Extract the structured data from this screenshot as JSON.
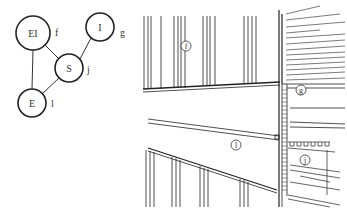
{
  "graph": {
    "nodes": [
      {
        "id": "EI",
        "label": "EI",
        "annotation": "f",
        "cx": 33,
        "cy": 33,
        "r": 17
      },
      {
        "id": "I",
        "label": "I",
        "annotation": "g",
        "cx": 100,
        "cy": 27,
        "r": 14
      },
      {
        "id": "S",
        "label": "S",
        "annotation": "j",
        "cx": 69,
        "cy": 68,
        "r": 14
      },
      {
        "id": "E",
        "label": "E",
        "annotation": "l",
        "cx": 32,
        "cy": 103,
        "r": 14
      }
    ],
    "edges": [
      {
        "from": "EI",
        "to": "S"
      },
      {
        "from": "EI",
        "to": "E"
      },
      {
        "from": "S",
        "to": "I"
      },
      {
        "from": "S",
        "to": "E"
      }
    ]
  },
  "drawing": {
    "callouts": [
      {
        "id": "f",
        "label": "f"
      },
      {
        "id": "g",
        "label": "g"
      },
      {
        "id": "l",
        "label": "l"
      },
      {
        "id": "j",
        "label": "j"
      }
    ]
  },
  "colors": {
    "stroke": "#222222",
    "background": "#ffffff"
  }
}
